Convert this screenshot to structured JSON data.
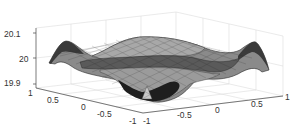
{
  "chart_data": {
    "type": "surface3d",
    "title": "",
    "xlabel": "",
    "ylabel": "",
    "zlabel": "",
    "grid": true,
    "colormap": "gray",
    "mesh": true,
    "x_range": [
      -1,
      1
    ],
    "y_range": [
      -1,
      1
    ],
    "zlim": [
      19.9,
      20.1
    ],
    "x_ticks": [
      "-1",
      "-0.5",
      "0",
      "0.5",
      "1"
    ],
    "y_ticks": [
      "1",
      "0.5",
      "0",
      "-0.5",
      "-1"
    ],
    "z_ticks": [
      "20.1",
      "20",
      "19.9"
    ]
  },
  "axes": {
    "z_labels": [
      {
        "text": "20.1",
        "x": 4,
        "y": 30
      },
      {
        "text": "20",
        "x": 19,
        "y": 55
      },
      {
        "text": "19.9",
        "x": 4,
        "y": 79
      }
    ],
    "y_labels": [
      {
        "text": "1",
        "x": 28,
        "y": 89
      },
      {
        "text": "0.5",
        "x": 47,
        "y": 96
      },
      {
        "text": "0",
        "x": 81,
        "y": 103
      },
      {
        "text": "-0.5",
        "x": 97,
        "y": 110
      },
      {
        "text": "-1",
        "x": 129,
        "y": 117
      }
    ],
    "x_labels": [
      {
        "text": "-1",
        "x": 143,
        "y": 117
      },
      {
        "text": "-0.5",
        "x": 177,
        "y": 111
      },
      {
        "text": "0",
        "x": 215,
        "y": 106
      },
      {
        "text": "0.5",
        "x": 251,
        "y": 100
      },
      {
        "text": "1",
        "x": 285,
        "y": 93
      }
    ]
  }
}
